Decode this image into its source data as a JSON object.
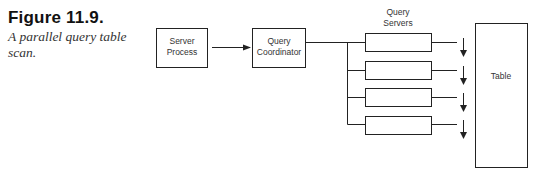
{
  "caption": {
    "figure_number": "Figure 11.9.",
    "description": "A parallel query table scan."
  },
  "diagram": {
    "server_process": {
      "line1": "Server",
      "line2": "Process"
    },
    "query_coordinator": {
      "line1": "Query",
      "line2": "Coordinator"
    },
    "query_servers_label": {
      "line1": "Query",
      "line2": "Servers"
    },
    "query_server_count": 4,
    "table": {
      "label": "Table"
    },
    "colors": {
      "stroke": "#222222",
      "text": "#333333",
      "background": "#ffffff"
    }
  }
}
